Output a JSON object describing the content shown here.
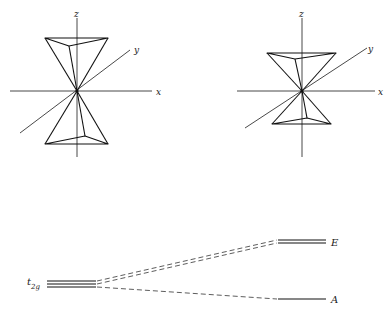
{
  "figures": {
    "left": {
      "axes": {
        "x": "x",
        "y": "y",
        "z": "z"
      },
      "description": "Two trigonal pyramids sharing an apex at the origin (octahedral-like arrangement)"
    },
    "right": {
      "axes": {
        "x": "x",
        "y": "y",
        "z": "z"
      },
      "description": "Two smaller, trigonally compressed pyramids sharing an apex at the origin"
    }
  },
  "energy_diagram": {
    "left_level": {
      "label_main": "t",
      "label_sub": "2g",
      "degeneracy": 3
    },
    "right_levels": [
      {
        "label": "E",
        "degeneracy": 2,
        "position": "upper"
      },
      {
        "label": "A",
        "degeneracy": 1,
        "position": "lower"
      }
    ]
  }
}
